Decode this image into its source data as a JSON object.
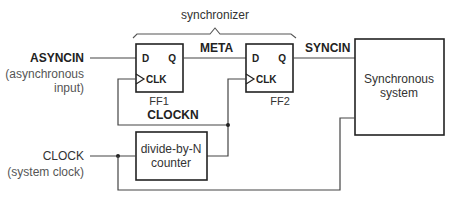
{
  "diagram": {
    "brace_label": "synchronizer",
    "inputs": {
      "asyncin": {
        "label": "ASYNCIN",
        "note_line1": "(asynchronous",
        "note_line2": "input)"
      },
      "clock": {
        "label": "CLOCK",
        "note": "(system clock)"
      }
    },
    "ff1": {
      "name": "FF1",
      "d": "D",
      "q": "Q",
      "clk": "CLK"
    },
    "ff2": {
      "name": "FF2",
      "d": "D",
      "q": "Q",
      "clk": "CLK"
    },
    "signals": {
      "meta": "META",
      "syncin": "SYNCIN",
      "clockn": "CLOCKN"
    },
    "counter": {
      "line1": "divide-by-N",
      "line2": "counter"
    },
    "system": {
      "line1": "Synchronous",
      "line2": "system"
    }
  }
}
